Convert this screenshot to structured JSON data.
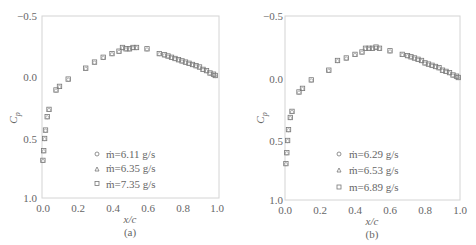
{
  "chart_data": [
    {
      "type": "scatter",
      "panel": "(a)",
      "xlabel": "x/c",
      "ylabel": "Cp",
      "xlim": [
        0.0,
        1.0
      ],
      "ylim": [
        1.0,
        -0.5
      ],
      "y_inverted": true,
      "xticks": [
        "0.0",
        "0.2",
        "0.4",
        "0.6",
        "0.8",
        "1.0"
      ],
      "yticks": [
        "-0.5",
        "0.0",
        "0.5",
        "1.0"
      ],
      "grid": false,
      "legend_position": "lower center",
      "series": [
        {
          "name": "ṁ=6.11 g/s",
          "marker": "circle"
        },
        {
          "name": "ṁ=6.35 g/s",
          "marker": "triangle"
        },
        {
          "name": "ṁ=7.35 g/s",
          "marker": "square"
        }
      ],
      "x": [
        0.005,
        0.01,
        0.015,
        0.02,
        0.03,
        0.04,
        0.08,
        0.1,
        0.15,
        0.25,
        0.3,
        0.35,
        0.4,
        0.44,
        0.46,
        0.48,
        0.5,
        0.52,
        0.54,
        0.6,
        0.67,
        0.7,
        0.72,
        0.74,
        0.76,
        0.78,
        0.8,
        0.82,
        0.84,
        0.86,
        0.88,
        0.9,
        0.92,
        0.94,
        0.96,
        0.98,
        0.99
      ],
      "values": [
        0.69,
        0.61,
        0.51,
        0.44,
        0.33,
        0.27,
        0.11,
        0.08,
        0.02,
        -0.07,
        -0.12,
        -0.16,
        -0.19,
        -0.21,
        -0.24,
        -0.23,
        -0.23,
        -0.24,
        -0.24,
        -0.23,
        -0.19,
        -0.18,
        -0.17,
        -0.16,
        -0.15,
        -0.14,
        -0.13,
        -0.12,
        -0.11,
        -0.1,
        -0.09,
        -0.08,
        -0.06,
        -0.05,
        -0.03,
        -0.02,
        -0.01
      ]
    },
    {
      "type": "scatter",
      "panel": "(b)",
      "xlabel": "x/c",
      "ylabel": "Cp",
      "xlim": [
        0.0,
        1.0
      ],
      "ylim": [
        1.0,
        -0.5
      ],
      "y_inverted": true,
      "xticks": [
        "0.0",
        "0.2",
        "0.4",
        "0.6",
        "0.8",
        "1.0"
      ],
      "yticks": [
        "-0.5",
        "0.0",
        "0.5",
        "1.0"
      ],
      "grid": false,
      "legend_position": "lower center",
      "series": [
        {
          "name": "ṁ=6.29 g/s",
          "marker": "circle"
        },
        {
          "name": "ṁ=6.53 g/s",
          "marker": "triangle"
        },
        {
          "name": "m=6.89 g/s",
          "marker": "square"
        }
      ],
      "x": [
        0.005,
        0.01,
        0.015,
        0.02,
        0.03,
        0.04,
        0.08,
        0.1,
        0.15,
        0.25,
        0.3,
        0.35,
        0.4,
        0.44,
        0.46,
        0.48,
        0.5,
        0.52,
        0.54,
        0.6,
        0.67,
        0.7,
        0.72,
        0.74,
        0.76,
        0.78,
        0.8,
        0.82,
        0.84,
        0.86,
        0.88,
        0.9,
        0.92,
        0.94,
        0.96,
        0.98,
        0.99
      ],
      "values": [
        0.7,
        0.61,
        0.51,
        0.42,
        0.32,
        0.27,
        0.11,
        0.08,
        0.01,
        -0.07,
        -0.15,
        -0.17,
        -0.2,
        -0.22,
        -0.25,
        -0.25,
        -0.25,
        -0.26,
        -0.25,
        -0.23,
        -0.2,
        -0.19,
        -0.18,
        -0.17,
        -0.16,
        -0.15,
        -0.13,
        -0.12,
        -0.11,
        -0.1,
        -0.09,
        -0.07,
        -0.06,
        -0.05,
        -0.03,
        -0.02,
        -0.01
      ]
    }
  ],
  "panels": [
    {
      "caption": "(a)",
      "ylabel": "C",
      "ylabel_sub": "p",
      "xlabel": "x/c",
      "yticks": [
        "−0.5",
        "0.0",
        "0.5",
        "1.0"
      ],
      "xticks": [
        "0.0",
        "0.2",
        "0.4",
        "0.6",
        "0.8",
        "1.0"
      ],
      "legend": [
        "ṁ=6.11 g/s",
        "ṁ=6.35 g/s",
        "ṁ=7.35 g/s"
      ]
    },
    {
      "caption": "(b)",
      "ylabel": "C",
      "ylabel_sub": "p",
      "xlabel": "x/c",
      "yticks": [
        "−0.5",
        "0.0",
        "0.5",
        "1.0"
      ],
      "xticks": [
        "0.0",
        "0.2",
        "0.4",
        "0.6",
        "0.8",
        "1.0"
      ],
      "legend": [
        "ṁ=6.29 g/s",
        "ṁ=6.53 g/s",
        "m=6.89 g/s"
      ]
    }
  ],
  "colors": {
    "axis": "#cfcfcf",
    "marker": "#777777",
    "text": "#666666"
  }
}
